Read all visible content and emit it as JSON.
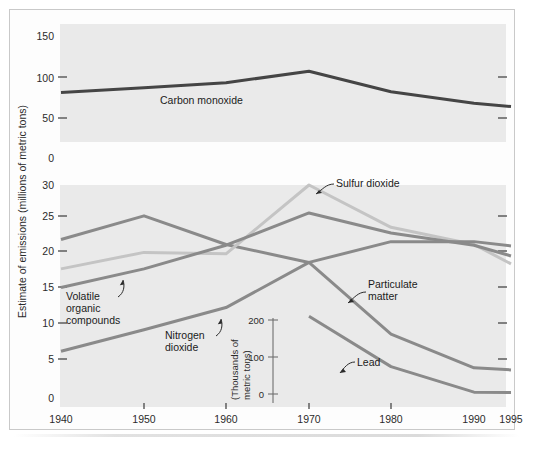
{
  "figure": {
    "background_color": "#ffffff",
    "panel_color": "#eaeaea",
    "y_axis_label": "Estimate of emissions (millions of metric tons)",
    "inset_axis_label_line1": "(Thousands of",
    "inset_axis_label_line2": "metric tons)"
  },
  "chart_data": {
    "type": "line",
    "title": "",
    "subtitle": "",
    "xlabel": "",
    "ylabel": "Estimate of emissions (millions of metric tons)",
    "grid": false,
    "legend_position": "inline-annotations",
    "x": [
      1940,
      1950,
      1960,
      1970,
      1980,
      1990,
      1995
    ],
    "xtick_labels": [
      "1940",
      "1950",
      "1960",
      "1970",
      "1980",
      "1990",
      "1995"
    ],
    "xlim": [
      1940,
      1995
    ],
    "panels": [
      {
        "name": "upper-panel",
        "ylim": [
          0,
          150
        ],
        "ytick_labels": [
          "150",
          "100",
          "50",
          "0"
        ],
        "yticks": [
          150,
          100,
          50,
          0
        ],
        "unit": "millions of metric tons",
        "series": [
          {
            "name": "Carbon monoxide",
            "color": "#454545",
            "width": 3.0,
            "values": [
              81,
              87,
              93,
              107,
              82,
              68,
              64
            ]
          }
        ]
      },
      {
        "name": "lower-panel",
        "ylim": [
          0,
          30
        ],
        "ytick_labels": [
          "30",
          "25",
          "20",
          "15",
          "10",
          "5",
          "0"
        ],
        "yticks": [
          30,
          25,
          20,
          15,
          10,
          5,
          0
        ],
        "unit": "millions of metric tons",
        "series": [
          {
            "name": "Particulate matter",
            "color": "#8a8a8a",
            "width": 3.0,
            "values": [
              21.7,
              25.0,
              21.0,
              18.5,
              8.5,
              3.8,
              3.5
            ]
          },
          {
            "name": "Sulfur dioxide",
            "color": "#c4c4c4",
            "width": 3.0,
            "values": [
              17.6,
              19.9,
              19.7,
              29.3,
              23.4,
              21.0,
              18.3
            ]
          },
          {
            "name": "Volatile organic compounds",
            "color": "#8a8a8a",
            "width": 3.0,
            "values": [
              15.0,
              17.6,
              20.9,
              25.4,
              22.6,
              20.9,
              19.4
            ]
          },
          {
            "name": "Nitrogen dioxide",
            "color": "#8a8a8a",
            "width": 3.0,
            "values": [
              6.1,
              9.1,
              12.2,
              18.5,
              21.4,
              21.4,
              20.8
            ]
          }
        ]
      },
      {
        "name": "lead-inset",
        "ylim": [
          0,
          230
        ],
        "ytick_labels": [
          "200",
          "100",
          "0"
        ],
        "yticks": [
          200,
          100,
          0
        ],
        "unit": "thousands of metric tons",
        "x": [
          1970,
          1980,
          1990,
          1995
        ],
        "series": [
          {
            "name": "Lead",
            "color": "#8a8a8a",
            "width": 3.0,
            "values": [
              210,
              74,
              5,
              4
            ]
          }
        ]
      }
    ],
    "annotations": [
      {
        "name": "Carbon monoxide",
        "text": "Carbon monoxide"
      },
      {
        "name": "Sulfur dioxide",
        "text": "Sulfur dioxide"
      },
      {
        "name": "Particulate matter",
        "text_line1": "Particulate",
        "text_line2": "matter"
      },
      {
        "name": "Volatile organic compounds",
        "text_line1": "Volatile",
        "text_line2": "organic",
        "text_line3": "compounds"
      },
      {
        "name": "Nitrogen dioxide",
        "text_line1": "Nitrogen",
        "text_line2": "dioxide"
      },
      {
        "name": "Lead",
        "text": "Lead"
      }
    ]
  },
  "ticks": {
    "upper_y": [
      "150",
      "100",
      "50",
      "0"
    ],
    "lower_y": [
      "30",
      "25",
      "20",
      "15",
      "10",
      "5",
      "0"
    ],
    "x": [
      "1940",
      "1950",
      "1960",
      "1970",
      "1980",
      "1990",
      "1995"
    ],
    "inset_y": [
      "200",
      "100",
      "0"
    ]
  },
  "labels": {
    "carbon_monoxide": "Carbon monoxide",
    "sulfur_dioxide": "Sulfur dioxide",
    "particulate_1": "Particulate",
    "particulate_2": "matter",
    "voc_1": "Volatile",
    "voc_2": "organic",
    "voc_3": "compounds",
    "nox_1": "Nitrogen",
    "nox_2": "dioxide",
    "lead": "Lead",
    "y_axis": "Estimate of emissions (millions of metric tons)",
    "inset_1": "(Thousands of",
    "inset_2": "metric tons)"
  }
}
